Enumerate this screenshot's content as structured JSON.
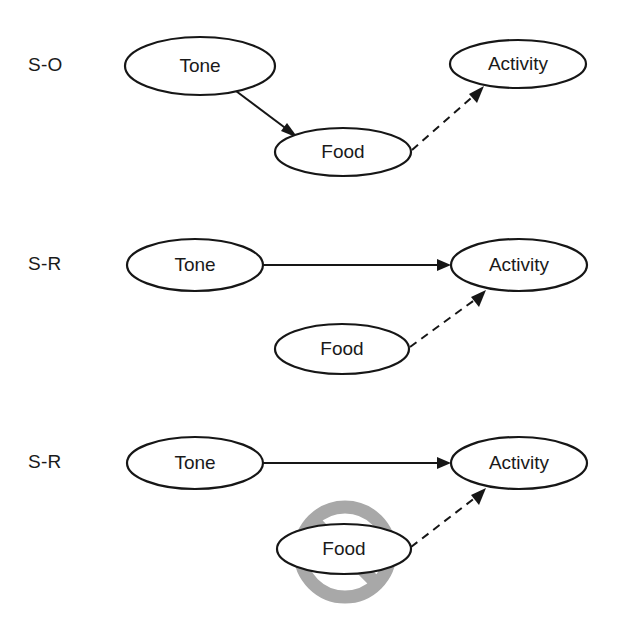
{
  "figure": {
    "background_color": "#ffffff",
    "ink_color": "#161616",
    "prohibit_color": "#a8a8a8",
    "width": 617,
    "height": 633
  },
  "panels": [
    {
      "id": "panel-s-o",
      "label": "S-O",
      "label_pos": {
        "x": 28,
        "y": 66
      },
      "nodes": [
        {
          "id": "tone",
          "label": "Tone",
          "cx": 200,
          "cy": 66,
          "rx": 75,
          "ry": 29
        },
        {
          "id": "food",
          "label": "Food",
          "cx": 343,
          "cy": 152,
          "rx": 68,
          "ry": 24
        },
        {
          "id": "activity",
          "label": "Activity",
          "cx": 518,
          "cy": 64,
          "rx": 68,
          "ry": 24
        }
      ],
      "edges": [
        {
          "id": "tone-to-food",
          "from": "tone",
          "to": "food",
          "style": "solid",
          "x1": 236,
          "y1": 91,
          "x2": 296,
          "y2": 136
        },
        {
          "id": "food-to-activity",
          "from": "food",
          "to": "activity",
          "style": "dashed",
          "x1": 412,
          "y1": 150,
          "x2": 482,
          "y2": 88
        }
      ],
      "prohibition": null
    },
    {
      "id": "panel-s-r-1",
      "label": "S-R",
      "label_pos": {
        "x": 28,
        "y": 265
      },
      "nodes": [
        {
          "id": "tone",
          "label": "Tone",
          "cx": 195,
          "cy": 265,
          "rx": 68,
          "ry": 26
        },
        {
          "id": "food",
          "label": "Food",
          "cx": 342,
          "cy": 349,
          "rx": 67,
          "ry": 25
        },
        {
          "id": "activity",
          "label": "Activity",
          "cx": 519,
          "cy": 265,
          "rx": 68,
          "ry": 26
        }
      ],
      "edges": [
        {
          "id": "tone-to-activity",
          "from": "tone",
          "to": "activity",
          "style": "solid",
          "x1": 264,
          "y1": 265,
          "x2": 449,
          "y2": 265
        },
        {
          "id": "food-to-activity",
          "from": "food",
          "to": "activity",
          "style": "dashed",
          "x1": 410,
          "y1": 347,
          "x2": 484,
          "y2": 292
        }
      ],
      "prohibition": null
    },
    {
      "id": "panel-s-r-2",
      "label": "S-R",
      "label_pos": {
        "x": 28,
        "y": 463
      },
      "nodes": [
        {
          "id": "tone",
          "label": "Tone",
          "cx": 195,
          "cy": 463,
          "rx": 68,
          "ry": 26
        },
        {
          "id": "food",
          "label": "Food",
          "cx": 344,
          "cy": 549,
          "rx": 67,
          "ry": 25
        },
        {
          "id": "activity",
          "label": "Activity",
          "cx": 519,
          "cy": 463,
          "rx": 68,
          "ry": 26
        }
      ],
      "edges": [
        {
          "id": "tone-to-activity",
          "from": "tone",
          "to": "activity",
          "style": "solid",
          "x1": 264,
          "y1": 463,
          "x2": 449,
          "y2": 463
        },
        {
          "id": "food-to-activity",
          "from": "food",
          "to": "activity",
          "style": "dashed",
          "x1": 411,
          "y1": 547,
          "x2": 484,
          "y2": 490
        }
      ],
      "prohibition": {
        "id": "food-prohibited",
        "target": "food",
        "cx": 345,
        "cy": 552,
        "r": 45,
        "slash_angle_deg": 45,
        "meaning": "no-symbol"
      }
    }
  ],
  "legend": {
    "solid_edge_meaning": "excitatory association (solid arrow)",
    "dashed_edge_meaning": "response-evoking link (dashed arrow)",
    "prohibition_meaning": "outcome devalued / unavailable"
  }
}
